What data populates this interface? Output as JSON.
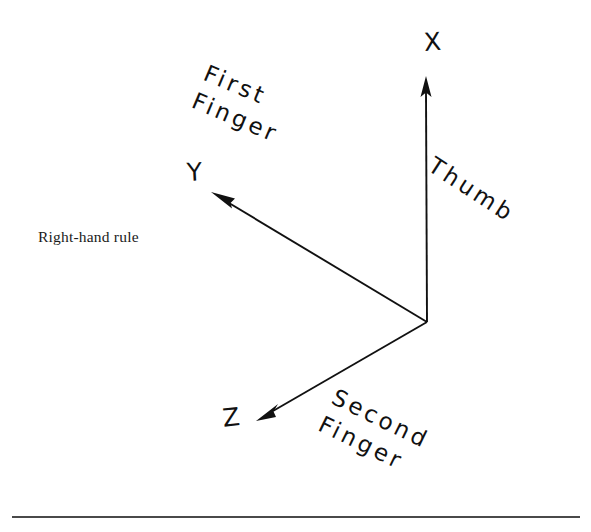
{
  "figure": {
    "caption": "Right-hand rule",
    "background_color": "#ffffff",
    "ink_color": "#111111",
    "rule_color": "#4a4a4a"
  },
  "axes": [
    {
      "id": "x",
      "label": "X",
      "hand_label": "Thumb",
      "direction": "up",
      "origin": [
        427,
        322
      ],
      "tip": [
        426,
        78
      ]
    },
    {
      "id": "y",
      "label": "Y",
      "hand_label": "First\nFinger",
      "hand_label_line1": "First",
      "hand_label_line2": "Finger",
      "direction": "upper-left",
      "origin": [
        427,
        322
      ],
      "tip": [
        212,
        193
      ]
    },
    {
      "id": "z",
      "label": "Z",
      "hand_label": "Second\nFinger",
      "hand_label_line1": "Second",
      "hand_label_line2": "Finger",
      "direction": "lower-left",
      "origin": [
        427,
        322
      ],
      "tip": [
        257,
        420
      ]
    }
  ],
  "labels": {
    "x_axis": "X",
    "y_axis": "Y",
    "z_axis": "Z",
    "thumb": "Thumb",
    "first_line1": "First",
    "first_line2": "Finger",
    "second_line1": "Second",
    "second_line2": "Finger"
  }
}
